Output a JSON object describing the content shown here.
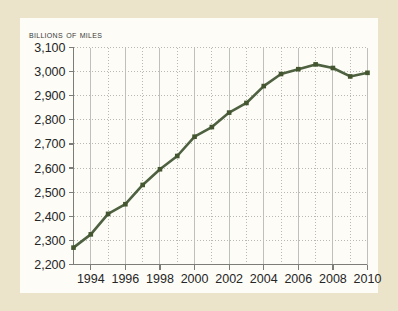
{
  "canvas": {
    "width": 398,
    "height": 311
  },
  "colors": {
    "page_background": "#ece4ca",
    "card_background": "#fdfcf7",
    "line": "#4e6140",
    "marker": "#44562f",
    "axis": "#7c7c78",
    "gridline": "#b9b9b4",
    "gridline_major": "#bfbfbb",
    "text": "#262626"
  },
  "chart_data": {
    "type": "line",
    "title": "Billions of Miles",
    "xlabel": "",
    "ylabel": "Billions of Miles",
    "ylim": [
      2200,
      3100
    ],
    "xlim": [
      1993,
      2010
    ],
    "grid": true,
    "legend": "none",
    "ytick_labels": [
      "3,100",
      "3,000",
      "2,900",
      "2,800",
      "2,700",
      "2,600",
      "2,500",
      "2,400",
      "2,300",
      "2,200"
    ],
    "ytick_values": [
      3100,
      3000,
      2900,
      2800,
      2700,
      2600,
      2500,
      2400,
      2300,
      2200
    ],
    "xtick_labels": [
      "1994",
      "1996",
      "1998",
      "2000",
      "2002",
      "2004",
      "2006",
      "2008",
      "2010"
    ],
    "xtick_values": [
      1994,
      1996,
      1998,
      2000,
      2002,
      2004,
      2006,
      2008,
      2010
    ],
    "x": [
      1993,
      1994,
      1995,
      1996,
      1997,
      1998,
      1999,
      2000,
      2001,
      2002,
      2003,
      2004,
      2005,
      2006,
      2007,
      2008,
      2009,
      2010
    ],
    "values": [
      2270,
      2325,
      2410,
      2450,
      2530,
      2595,
      2650,
      2730,
      2770,
      2830,
      2870,
      2940,
      2990,
      3010,
      3030,
      3015,
      2980,
      2995
    ],
    "series": [
      {
        "name": "Vehicle miles traveled",
        "values": [
          2270,
          2325,
          2410,
          2450,
          2530,
          2595,
          2650,
          2730,
          2770,
          2830,
          2870,
          2940,
          2990,
          3010,
          3030,
          3015,
          2980,
          2995
        ]
      }
    ]
  }
}
